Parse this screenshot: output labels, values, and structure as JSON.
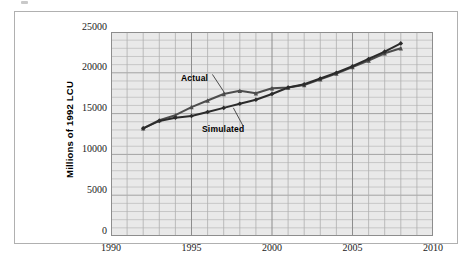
{
  "chart_data": {
    "type": "line",
    "title": "",
    "xlabel": "",
    "ylabel": "Millions of 1992 LCU",
    "xlim": [
      1990,
      2010
    ],
    "ylim": [
      0,
      25000
    ],
    "x_ticks": [
      1990,
      1995,
      2000,
      2005,
      2010
    ],
    "x_tick_labels": [
      "1990",
      "1995",
      "2000",
      "2005",
      "2010"
    ],
    "x_minor_step": 1,
    "y_ticks": [
      0,
      5000,
      10000,
      15000,
      20000,
      25000
    ],
    "y_tick_labels": [
      "0",
      "5000",
      "10000",
      "15000",
      "20000",
      "25000"
    ],
    "y_minor_step": 1000,
    "grid": true,
    "legend": "annotations-on-plot",
    "plot_background": "#e9e9e9",
    "gridline_color": "#9a9a9a",
    "series": [
      {
        "name": "Actual",
        "marker": "triangle",
        "color": "#4d4d4d",
        "x": [
          1992,
          1993,
          1994,
          1995,
          1996,
          1997,
          1998,
          1999,
          2000,
          2001,
          2002,
          2003,
          2004,
          2005,
          2006,
          2007,
          2008
        ],
        "values": [
          13200,
          14200,
          14800,
          15800,
          16600,
          17400,
          17800,
          17500,
          18100,
          18200,
          18500,
          19200,
          19900,
          20700,
          21500,
          22400,
          23000
        ]
      },
      {
        "name": "Simulated",
        "marker": "diamond",
        "color": "#2b2b2b",
        "x": [
          1992,
          1993,
          1994,
          1995,
          1996,
          1997,
          1998,
          1999,
          2000,
          2001,
          2002,
          2003,
          2004,
          2005,
          2006,
          2007,
          2008
        ],
        "values": [
          13200,
          14100,
          14500,
          14700,
          15200,
          15700,
          16200,
          16700,
          17400,
          18200,
          18600,
          19300,
          20000,
          20800,
          21700,
          22600,
          23600
        ]
      }
    ],
    "annotations": [
      {
        "text": "Actual",
        "x": 1996.3,
        "y": 19800,
        "target_x": 1997.1,
        "target_y": 17400
      },
      {
        "text": "Simulated",
        "x": 1998.2,
        "y": 13500,
        "target_x": 1997.6,
        "target_y": 15700
      }
    ]
  }
}
